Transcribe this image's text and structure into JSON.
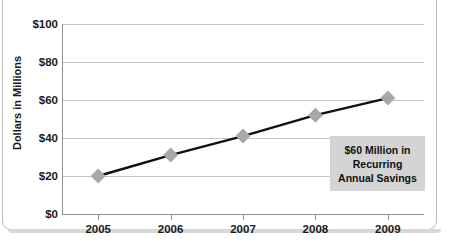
{
  "chart_data": {
    "type": "line",
    "title": "",
    "xlabel": "",
    "ylabel": "Dollars in Millions",
    "categories": [
      "2005",
      "2006",
      "2007",
      "2008",
      "2009"
    ],
    "values": [
      20,
      31,
      41,
      52,
      61
    ],
    "series": [
      {
        "name": "Annual Savings",
        "values": [
          20,
          31,
          41,
          52,
          61
        ]
      }
    ],
    "ylim": [
      0,
      100
    ],
    "ytick_labels": [
      "$0",
      "$20",
      "$40",
      "$60",
      "$80",
      "$100"
    ],
    "ytick_values": [
      0,
      20,
      40,
      60,
      80,
      100
    ],
    "grid": true,
    "legend": "none",
    "marker": "diamond",
    "annotations": [
      {
        "lines": [
          "$60 Million in",
          "Recurring",
          "Annual Savings"
        ],
        "background": "#d4d4d4"
      }
    ],
    "colors": {
      "line": "#101010",
      "marker": "#a8a8a8",
      "gridline": "#c6c6c6",
      "axis": "#8f8f8f",
      "text": "#1a1a1a",
      "annotation_bg": "#d4d4d4",
      "card_border": "#b9b9b9"
    }
  },
  "annotation": {
    "line1": "$60 Million in",
    "line2": "Recurring",
    "line3": "Annual Savings"
  }
}
